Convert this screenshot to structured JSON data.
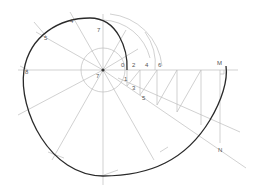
{
  "diagram": {
    "center": {
      "x": 103,
      "y": 70
    },
    "colors": {
      "curve": "#2a2a2a",
      "construction": "#b8b8b8",
      "label": "#555555"
    },
    "labels": {
      "p0": "0",
      "p1": "1",
      "p2": "2",
      "p3": "3",
      "p4": "4",
      "p5": "5",
      "p6": "6",
      "p7": "7",
      "p8": "8",
      "left_a": "4",
      "left_b": "5",
      "left_c": "8",
      "M": "M",
      "N": "N"
    }
  }
}
